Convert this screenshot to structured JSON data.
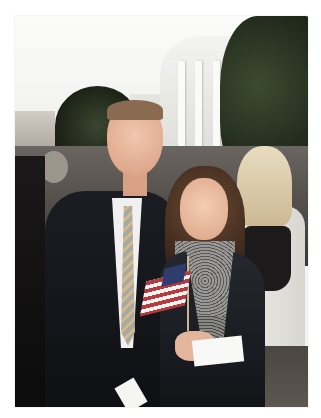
{
  "image": {
    "type": "photograph",
    "description": "Smiling man in dark suit and striped tie posing with a smiling woman holding small American flags in front of the White House, crowd in background",
    "frame_color": "#ffffff",
    "photo_bounds": {
      "left": 15,
      "top": 16,
      "width": 293,
      "height": 391
    },
    "scene_elements": [
      "White House portico with columns",
      "trees",
      "crowd",
      "man in dark suit",
      "woman in dark jacket",
      "American flags",
      "papers in hands"
    ],
    "colors": {
      "sky": "#f4f4f2",
      "suit": "#14161a",
      "flag_red": "#b83a3e",
      "flag_blue": "#2f3d6e",
      "foliage": "#2a3424"
    }
  }
}
